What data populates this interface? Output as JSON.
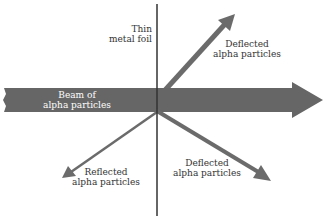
{
  "diagram": {
    "labels": {
      "foil": [
        "Thin",
        "metal foil"
      ],
      "beam": [
        "Beam of",
        "alpha particles"
      ],
      "deflected_upper": [
        "Deflected",
        "alpha particles"
      ],
      "deflected_lower": [
        "Deflected",
        "alpha particles"
      ],
      "reflected": [
        "Reflected",
        "alpha particles"
      ]
    },
    "colors": {
      "beam": "#666666",
      "arrow": "#6b6b6b",
      "foil": "#333333",
      "text": "#333333",
      "beam_text": "#ffffff"
    }
  }
}
